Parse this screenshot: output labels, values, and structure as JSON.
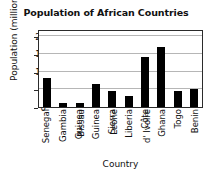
{
  "chart_data": {
    "type": "bar",
    "title": "Population of African Countries",
    "xlabel": "Country",
    "ylabel": "Population (millions)",
    "categories": [
      "Senegal",
      "Gambia",
      "Guinea Bissau",
      "Guinea",
      "Sierra Leone",
      "Liberia",
      "Côte d' Ivoire",
      "Ghana",
      "Togo",
      "Benin"
    ],
    "category_lines": [
      [
        "Senegal"
      ],
      [
        "Gambia"
      ],
      [
        "Guinea",
        "Bissau"
      ],
      [
        "Guinea"
      ],
      [
        "Sierra",
        "Leone"
      ],
      [
        "Liberia"
      ],
      [
        "Côte",
        "d' Ivoire"
      ],
      [
        "Ghana"
      ],
      [
        "Togo"
      ],
      [
        "Benin"
      ]
    ],
    "values": [
      8.2,
      1.2,
      1.2,
      6.5,
      4.6,
      3.0,
      14.0,
      17.0,
      4.4,
      5.2
    ],
    "ylim": [
      0,
      22
    ],
    "yticks": [
      0,
      5,
      10,
      15,
      20
    ],
    "grid": true,
    "legend": false,
    "bar_color": "#000000",
    "grid_color": "#b6b6b6",
    "axis_color": "#2b2b2b",
    "background": "#ffffff"
  }
}
